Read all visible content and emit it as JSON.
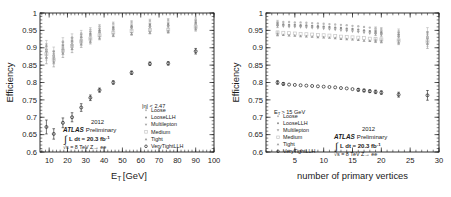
{
  "figure": {
    "background_color": "#ffffff",
    "foreground_color": "#1a1a1a"
  },
  "series_style": {
    "Loose": {
      "color": "#b9b9b9",
      "marker": "circle-filled"
    },
    "LooseLLH": {
      "color": "#8f8f8f",
      "marker": "circle-filled"
    },
    "Multilepton": {
      "color": "#a2a2a2",
      "marker": "triangle-down"
    },
    "Medium": {
      "color": "#c9c9c9",
      "marker": "square-open"
    },
    "Tight": {
      "color": "#9a9a9a",
      "marker": "triangle-up"
    },
    "VeryTightLLH": {
      "color": "#2b2b2b",
      "marker": "circle-open"
    }
  },
  "legend_labels": [
    "Loose",
    "LooseLLH",
    "Multilepton",
    "Medium",
    "Tight",
    "VeryTightLLH"
  ],
  "annotation": {
    "atlas": "ATLAS",
    "preliminary": "Preliminary",
    "year": "2012",
    "integral_symbol": "∫",
    "lumi": "L dt = 20.3 fb",
    "lumi_exp": "-1",
    "cme": "√s = 8 TeV Z→ ee"
  },
  "chart_data": [
    {
      "id": "efficiency-vs-et",
      "type": "scatter",
      "title": "",
      "xlabel": "E_T [GeV]",
      "xlabel_base": "E",
      "xlabel_sub": "T",
      "xlabel_unit": "[GeV]",
      "ylabel": "Efficiency",
      "xlim": [
        5,
        100
      ],
      "ylim": [
        0.6,
        1.0
      ],
      "xticks": [
        10,
        20,
        30,
        40,
        50,
        60,
        70,
        80,
        90,
        100
      ],
      "yticks": [
        0.6,
        0.65,
        0.7,
        0.75,
        0.8,
        0.85,
        0.9,
        0.95,
        1
      ],
      "ytick_labels": [
        "0.6",
        "0.65",
        "0.7",
        "0.75",
        "0.8",
        "0.85",
        "0.9",
        "0.95",
        "1"
      ],
      "grid": false,
      "legend_position": "lower-right",
      "legend_header": "|η| < 2.47",
      "x": [
        8.5,
        12.5,
        17.5,
        22.5,
        27.5,
        32.5,
        37.5,
        45,
        55,
        65,
        75,
        90
      ],
      "series": [
        {
          "name": "Loose",
          "values": [
            0.905,
            0.89,
            0.918,
            0.93,
            0.942,
            0.952,
            0.962,
            0.97,
            0.974,
            0.978,
            0.98,
            0.982
          ],
          "errors": [
            0.016,
            0.012,
            0.011,
            0.01,
            0.008,
            0.006,
            0.005,
            0.004,
            0.004,
            0.004,
            0.004,
            0.006
          ]
        },
        {
          "name": "LooseLLH",
          "values": [
            0.895,
            0.878,
            0.905,
            0.918,
            0.93,
            0.94,
            0.95,
            0.958,
            0.962,
            0.966,
            0.968,
            0.972
          ],
          "errors": [
            0.016,
            0.012,
            0.011,
            0.01,
            0.008,
            0.006,
            0.005,
            0.004,
            0.004,
            0.004,
            0.004,
            0.006
          ]
        },
        {
          "name": "Multilepton",
          "values": [
            0.888,
            0.872,
            0.898,
            0.912,
            0.922,
            0.932,
            0.942,
            0.95,
            0.955,
            0.958,
            0.96,
            0.964
          ],
          "errors": [
            0.016,
            0.012,
            0.011,
            0.01,
            0.008,
            0.006,
            0.005,
            0.004,
            0.004,
            0.004,
            0.004,
            0.006
          ]
        },
        {
          "name": "Medium",
          "values": [
            0.882,
            0.866,
            0.892,
            0.905,
            0.918,
            0.926,
            0.936,
            0.944,
            0.948,
            0.951,
            0.952,
            0.96
          ],
          "errors": [
            0.018,
            0.013,
            0.012,
            0.011,
            0.009,
            0.007,
            0.005,
            0.004,
            0.004,
            0.004,
            0.004,
            0.006
          ]
        },
        {
          "name": "Tight",
          "values": [
            0.872,
            0.858,
            0.884,
            0.897,
            0.91,
            0.918,
            0.928,
            0.936,
            0.94,
            0.944,
            0.946,
            0.954
          ],
          "errors": [
            0.018,
            0.013,
            0.012,
            0.011,
            0.009,
            0.007,
            0.005,
            0.004,
            0.004,
            0.004,
            0.004,
            0.006
          ]
        },
        {
          "name": "VeryTightLLH",
          "values": [
            0.672,
            0.652,
            0.684,
            0.7,
            0.728,
            0.756,
            0.778,
            0.8,
            0.828,
            0.854,
            0.855,
            0.89
          ],
          "errors": [
            0.02,
            0.015,
            0.014,
            0.013,
            0.011,
            0.008,
            0.006,
            0.005,
            0.005,
            0.005,
            0.005,
            0.008
          ]
        }
      ]
    },
    {
      "id": "efficiency-vs-npv",
      "type": "scatter",
      "title": "",
      "xlabel": "number of primary vertices",
      "ylabel": "Efficiency",
      "xlim": [
        0,
        30
      ],
      "ylim": [
        0.6,
        1.0
      ],
      "xticks": [
        5,
        10,
        15,
        20,
        25,
        30
      ],
      "yticks": [
        0.6,
        0.65,
        0.7,
        0.75,
        0.8,
        0.85,
        0.9,
        0.95,
        1
      ],
      "ytick_labels": [
        "0.6",
        "0.65",
        "0.7",
        "0.75",
        "0.8",
        "0.85",
        "0.9",
        "0.95",
        "1"
      ],
      "grid": false,
      "legend_position": "lower-left",
      "legend_header": "E_T > 15 GeV",
      "legend_header_base": "E",
      "legend_header_sub": "T",
      "legend_header_rest": "> 15 GeV",
      "x": [
        2,
        3,
        4,
        5,
        6,
        7,
        8,
        9,
        10,
        11,
        12,
        13,
        14,
        15,
        16,
        17,
        18,
        19,
        20,
        23,
        28
      ],
      "series": [
        {
          "name": "Loose",
          "values": [
            0.975,
            0.974,
            0.974,
            0.973,
            0.973,
            0.972,
            0.971,
            0.97,
            0.969,
            0.968,
            0.967,
            0.966,
            0.965,
            0.963,
            0.962,
            0.96,
            0.958,
            0.956,
            0.954,
            0.948,
            0.944
          ],
          "errors": [
            0.004,
            0.003,
            0.002,
            0.002,
            0.002,
            0.002,
            0.002,
            0.002,
            0.002,
            0.002,
            0.002,
            0.002,
            0.002,
            0.002,
            0.003,
            0.003,
            0.003,
            0.004,
            0.004,
            0.006,
            0.014
          ]
        },
        {
          "name": "LooseLLH",
          "values": [
            0.968,
            0.967,
            0.966,
            0.966,
            0.965,
            0.964,
            0.963,
            0.962,
            0.961,
            0.96,
            0.958,
            0.957,
            0.955,
            0.954,
            0.952,
            0.95,
            0.948,
            0.946,
            0.944,
            0.938,
            0.932
          ],
          "errors": [
            0.004,
            0.003,
            0.002,
            0.002,
            0.002,
            0.002,
            0.002,
            0.002,
            0.002,
            0.002,
            0.002,
            0.002,
            0.002,
            0.002,
            0.003,
            0.003,
            0.003,
            0.004,
            0.004,
            0.006,
            0.014
          ]
        },
        {
          "name": "Multilepton",
          "values": [
            0.962,
            0.961,
            0.96,
            0.96,
            0.959,
            0.958,
            0.957,
            0.956,
            0.955,
            0.953,
            0.952,
            0.95,
            0.948,
            0.947,
            0.945,
            0.943,
            0.941,
            0.939,
            0.937,
            0.93,
            0.925
          ],
          "errors": [
            0.004,
            0.003,
            0.002,
            0.002,
            0.002,
            0.002,
            0.002,
            0.002,
            0.002,
            0.002,
            0.002,
            0.002,
            0.002,
            0.002,
            0.003,
            0.003,
            0.003,
            0.004,
            0.004,
            0.006,
            0.014
          ]
        },
        {
          "name": "Medium",
          "values": [
            0.944,
            0.943,
            0.942,
            0.941,
            0.94,
            0.939,
            0.938,
            0.937,
            0.936,
            0.935,
            0.934,
            0.932,
            0.931,
            0.93,
            0.929,
            0.928,
            0.926,
            0.925,
            0.924,
            0.921,
            0.918
          ],
          "errors": [
            0.004,
            0.003,
            0.002,
            0.002,
            0.002,
            0.002,
            0.002,
            0.002,
            0.002,
            0.002,
            0.002,
            0.002,
            0.002,
            0.002,
            0.003,
            0.003,
            0.003,
            0.004,
            0.004,
            0.006,
            0.014
          ]
        },
        {
          "name": "Tight",
          "values": [
            0.938,
            0.937,
            0.936,
            0.935,
            0.934,
            0.933,
            0.932,
            0.931,
            0.93,
            0.929,
            0.928,
            0.926,
            0.925,
            0.924,
            0.923,
            0.921,
            0.92,
            0.919,
            0.918,
            0.915,
            0.912
          ],
          "errors": [
            0.004,
            0.003,
            0.002,
            0.002,
            0.002,
            0.002,
            0.002,
            0.002,
            0.002,
            0.002,
            0.002,
            0.002,
            0.002,
            0.002,
            0.003,
            0.003,
            0.003,
            0.004,
            0.004,
            0.006,
            0.014
          ]
        },
        {
          "name": "VeryTightLLH",
          "values": [
            0.8,
            0.796,
            0.794,
            0.793,
            0.792,
            0.791,
            0.79,
            0.789,
            0.788,
            0.787,
            0.786,
            0.784,
            0.783,
            0.781,
            0.779,
            0.777,
            0.775,
            0.773,
            0.771,
            0.765,
            0.763
          ],
          "errors": [
            0.005,
            0.004,
            0.003,
            0.003,
            0.003,
            0.003,
            0.003,
            0.003,
            0.003,
            0.003,
            0.003,
            0.003,
            0.003,
            0.003,
            0.004,
            0.004,
            0.004,
            0.005,
            0.005,
            0.007,
            0.014
          ]
        }
      ]
    }
  ]
}
